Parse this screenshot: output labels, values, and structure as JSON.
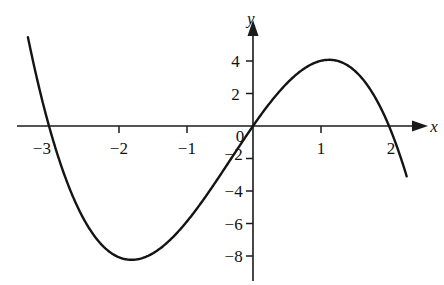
{
  "figure": {
    "background_color": "#ffffff",
    "curve_color": "#141414",
    "axis_color": "#1a1a1a"
  },
  "axes": {
    "x_axis_label": "x",
    "y_axis_label": "y",
    "origin_label": "0"
  },
  "labels": {
    "x_neg3": "−3",
    "x_neg2": "−2",
    "x_neg1": "−1",
    "x_1": "1",
    "x_2": "2",
    "y_4": "4",
    "y_2": "2",
    "y_neg2": "−2",
    "y_neg4": "−4",
    "y_neg6": "−6",
    "y_neg8": "−8"
  },
  "chart_data": {
    "type": "line",
    "title": "",
    "xlabel": "x",
    "ylabel": "y",
    "xlim": [
      -3.35,
      2.3
    ],
    "ylim": [
      -8.6,
      4.8
    ],
    "grid": false,
    "legend": null,
    "equation": "y = 6x - x^2 - x^3",
    "x_ticks": [
      -3,
      -2,
      -1,
      0,
      1,
      2
    ],
    "x_tick_labels": [
      "−3",
      "−2",
      "−1",
      "0",
      "1",
      "2"
    ],
    "y_ticks": [
      -8,
      -6,
      -4,
      -2,
      0,
      2,
      4
    ],
    "y_tick_labels": [
      "−8",
      "−6",
      "−4",
      "−2",
      "0",
      "2",
      "4"
    ],
    "roots": [
      -3,
      0,
      2
    ],
    "local_minimum": {
      "x": -1.79,
      "y": -8.21
    },
    "local_maximum": {
      "x": 1.12,
      "y": 4.06
    },
    "domain_drawn": [
      -3.31,
      2.26
    ],
    "series": [
      {
        "name": "y = 6x - x^2 - x^3",
        "x": [
          -3.31,
          -3.2,
          -3.1,
          -3.0,
          -2.9,
          -2.8,
          -2.7,
          -2.6,
          -2.5,
          -2.4,
          -2.3,
          -2.2,
          -2.1,
          -2.0,
          -1.9,
          -1.8,
          -1.7,
          -1.6,
          -1.5,
          -1.4,
          -1.3,
          -1.2,
          -1.1,
          -1.0,
          -0.9,
          -0.8,
          -0.7,
          -0.6,
          -0.5,
          -0.4,
          -0.3,
          -0.2,
          -0.1,
          0.0,
          0.1,
          0.2,
          0.3,
          0.4,
          0.5,
          0.6,
          0.7,
          0.8,
          0.9,
          1.0,
          1.1,
          1.2,
          1.3,
          1.4,
          1.5,
          1.6,
          1.7,
          1.8,
          1.9,
          2.0,
          2.1,
          2.2,
          2.26
        ],
        "y": [
          5.43,
          3.58,
          1.88,
          0.0,
          -1.82,
          -3.58,
          -5.27,
          -6.86,
          -8.38,
          -9.79,
          -11.11,
          -12.32,
          -13.43,
          -8.0,
          -8.08,
          -8.06,
          -7.98,
          -7.82,
          -7.5,
          -7.22,
          -6.69,
          -6.11,
          -5.48,
          -4.81,
          -4.11,
          -3.39,
          -2.65,
          -1.9,
          -1.13,
          -0.35,
          0.42,
          1.17,
          1.91,
          0.0,
          0.59,
          1.17,
          1.72,
          2.26,
          2.75,
          3.17,
          3.57,
          3.85,
          4.06,
          4.15,
          4.2,
          4.03,
          3.79,
          3.29,
          2.86,
          2.15,
          1.4,
          0.35,
          -0.9,
          -2.0,
          -3.84,
          -5.66,
          -6.86
        ]
      }
    ]
  },
  "geometry": {
    "origin_px": {
      "x": 253,
      "y": 126
    },
    "unit_px": {
      "x": 68,
      "y": 16.3
    }
  }
}
